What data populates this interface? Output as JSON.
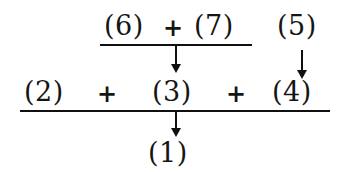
{
  "diagram": {
    "background_color": "#ffffff",
    "ink_color": "#101010",
    "numerator_row": {
      "left_term": "(6)",
      "operator": "+",
      "right_term": "(7)"
    },
    "side_term": {
      "label": "(5)"
    },
    "denominator_row": {
      "term_1": "(2)",
      "operator_1": "+",
      "term_2": "(3)",
      "operator_2": "+",
      "term_3": "(4)"
    },
    "result_row": {
      "label": "(1)"
    },
    "bars": [
      {
        "name": "upper-fraction-bar"
      },
      {
        "name": "main-fraction-bar"
      }
    ],
    "arrows": [
      {
        "name": "arrow-upper-to-three",
        "from": "(6) + (7)",
        "to": "(3)"
      },
      {
        "name": "arrow-five-to-four",
        "from": "(5)",
        "to": "(4)"
      },
      {
        "name": "arrow-main-to-one",
        "from": "(2) + (3) + (4)",
        "to": "(1)"
      }
    ]
  }
}
